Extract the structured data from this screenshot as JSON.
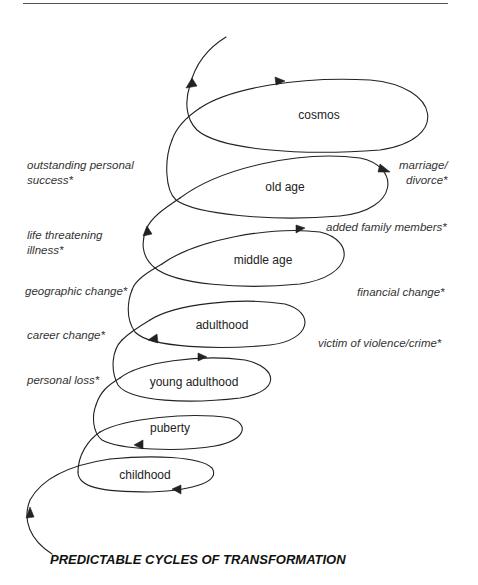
{
  "diagram": {
    "title": "PREDICTABLE CYCLES OF TRANSFORMATION",
    "stages": [
      {
        "id": "childhood",
        "label": "childhood"
      },
      {
        "id": "puberty",
        "label": "puberty"
      },
      {
        "id": "young-adulthood",
        "label": "young adulthood"
      },
      {
        "id": "adulthood",
        "label": "adulthood"
      },
      {
        "id": "middle-age",
        "label": "middle age"
      },
      {
        "id": "old-age",
        "label": "old age"
      },
      {
        "id": "cosmos",
        "label": "cosmos"
      }
    ],
    "events_left": [
      {
        "line1": "outstanding personal",
        "line2": "success*"
      },
      {
        "line1": "life threatening",
        "line2": "illness*"
      },
      {
        "line1": "geographic change*",
        "line2": ""
      },
      {
        "line1": "career change*",
        "line2": ""
      },
      {
        "line1": "personal loss*",
        "line2": ""
      }
    ],
    "events_right": [
      {
        "line1": "marriage/",
        "line2": "divorce*"
      },
      {
        "line1": "added family members*",
        "line2": ""
      },
      {
        "line1": "financial change*",
        "line2": ""
      },
      {
        "line1": "victim of violence/crime*",
        "line2": ""
      }
    ],
    "colors": {
      "stroke": "#222222",
      "text": "#222222",
      "background": "#ffffff"
    }
  }
}
